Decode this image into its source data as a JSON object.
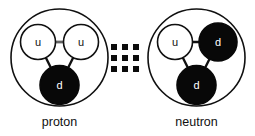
{
  "figure": {
    "name": "proton-neutron-quark-structure",
    "background_color": "#ffffff",
    "line_color": "#101010",
    "quark_up_fill": "#ffffff",
    "quark_down_fill": "#080808",
    "width": 255,
    "height": 136
  },
  "nucleons": [
    {
      "id": "proton",
      "caption": "proton",
      "shell": {
        "cx": 59.5,
        "cy": 57.5,
        "r": 48.5
      },
      "caption_pos": {
        "x": 59.5,
        "y": 126
      },
      "quarks": [
        {
          "id": "proton-quark-u-left",
          "label": "u",
          "type": "up",
          "cx": 38.0,
          "cy": 42.0,
          "r": 17.5
        },
        {
          "id": "proton-quark-u-right",
          "label": "u",
          "type": "up",
          "cx": 81.0,
          "cy": 42.0,
          "r": 17.5
        },
        {
          "id": "proton-quark-d",
          "label": "d",
          "type": "down",
          "cx": 59.5,
          "cy": 85.0,
          "r": 19.5
        }
      ],
      "bonds": [
        {
          "id": "proton-bond-uu",
          "from": "proton-quark-u-left",
          "to": "proton-quark-u-right",
          "style": "double"
        },
        {
          "id": "proton-bond-ul-d",
          "from": "proton-quark-u-left",
          "to": "proton-quark-d",
          "style": "single"
        },
        {
          "id": "proton-bond-ur-d",
          "from": "proton-quark-u-right",
          "to": "proton-quark-d",
          "style": "single"
        }
      ]
    },
    {
      "id": "neutron",
      "caption": "neutron",
      "shell": {
        "cx": 196.5,
        "cy": 57.5,
        "r": 48.5
      },
      "caption_pos": {
        "x": 196.5,
        "y": 126
      },
      "quarks": [
        {
          "id": "neutron-quark-u",
          "label": "u",
          "type": "up",
          "cx": 175.0,
          "cy": 42.0,
          "r": 17.5
        },
        {
          "id": "neutron-quark-d-right",
          "label": "d",
          "type": "down",
          "cx": 218.0,
          "cy": 42.0,
          "r": 19.0
        },
        {
          "id": "neutron-quark-d-bottom",
          "label": "d",
          "type": "down",
          "cx": 196.5,
          "cy": 85.0,
          "r": 19.5
        }
      ],
      "bonds": [
        {
          "id": "neutron-bond-ud",
          "from": "neutron-quark-u",
          "to": "neutron-quark-d-right",
          "style": "single"
        },
        {
          "id": "neutron-bond-u-db",
          "from": "neutron-quark-u",
          "to": "neutron-quark-d-bottom",
          "style": "single"
        },
        {
          "id": "neutron-bond-dr-db",
          "from": "neutron-quark-d-right",
          "to": "neutron-quark-d-bottom",
          "style": "single"
        }
      ]
    }
  ],
  "exchange_field": {
    "id": "gluon-exchange-grid",
    "rows": 3,
    "cols": 3,
    "dot_size": 6,
    "x_positions": [
      114,
      125,
      136
    ],
    "y_positions": [
      47,
      58,
      69
    ],
    "color": "#0b0b0b"
  }
}
